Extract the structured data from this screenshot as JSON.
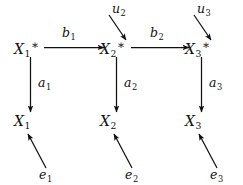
{
  "diagram": {
    "type": "signal-flow-block-diagram",
    "background_color": "#ffffff",
    "ink_color": "#111111",
    "nodes": {
      "top_row": [
        {
          "id": "x1-star",
          "base": "X",
          "subscript": "1",
          "starred": true,
          "x": 30,
          "y": 48
        },
        {
          "id": "x2-star",
          "base": "X",
          "subscript": "2",
          "starred": true,
          "x": 116,
          "y": 48
        },
        {
          "id": "x3-star",
          "base": "X",
          "subscript": "3",
          "starred": true,
          "x": 201,
          "y": 48
        }
      ],
      "bottom_row": [
        {
          "id": "x1",
          "base": "X",
          "subscript": "1",
          "starred": false,
          "x": 30,
          "y": 122
        },
        {
          "id": "x2",
          "base": "X",
          "subscript": "2",
          "starred": false,
          "x": 116,
          "y": 122
        },
        {
          "id": "x3",
          "base": "X",
          "subscript": "3",
          "starred": false,
          "x": 201,
          "y": 122
        }
      ]
    },
    "inputs": [
      {
        "id": "u2",
        "base": "u",
        "subscript": "2",
        "target": "x2-star"
      },
      {
        "id": "u3",
        "base": "u",
        "subscript": "3",
        "target": "x3-star"
      }
    ],
    "disturbances": [
      {
        "id": "e1",
        "base": "e",
        "subscript": "1",
        "target": "x1"
      },
      {
        "id": "e2",
        "base": "e",
        "subscript": "2",
        "target": "x2"
      },
      {
        "id": "e3",
        "base": "e",
        "subscript": "3",
        "target": "x3"
      }
    ],
    "edge_labels": {
      "horizontal": [
        {
          "id": "b1",
          "base": "b",
          "subscript": "1",
          "from": "x1-star",
          "to": "x2-star"
        },
        {
          "id": "b2",
          "base": "b",
          "subscript": "2",
          "from": "x2-star",
          "to": "x3-star"
        }
      ],
      "vertical": [
        {
          "id": "a1",
          "base": "a",
          "subscript": "1",
          "from": "x1-star",
          "to": "x1"
        },
        {
          "id": "a2",
          "base": "a",
          "subscript": "2",
          "from": "x2-star",
          "to": "x2"
        },
        {
          "id": "a3",
          "base": "a",
          "subscript": "3",
          "from": "x3-star",
          "to": "x3"
        }
      ]
    }
  }
}
